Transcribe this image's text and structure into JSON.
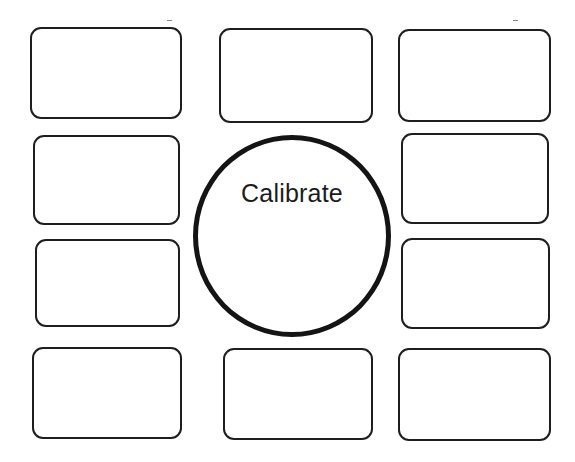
{
  "calibration": {
    "center_button": {
      "label": "Calibrate"
    },
    "targets": [
      {
        "id": 1,
        "position": "top-left"
      },
      {
        "id": 2,
        "position": "top-center"
      },
      {
        "id": 3,
        "position": "top-right"
      },
      {
        "id": 4,
        "position": "upper-left"
      },
      {
        "id": 5,
        "position": "upper-right"
      },
      {
        "id": 6,
        "position": "lower-left"
      },
      {
        "id": 7,
        "position": "lower-right"
      },
      {
        "id": 8,
        "position": "bottom-left"
      },
      {
        "id": 9,
        "position": "bottom-center"
      },
      {
        "id": 10,
        "position": "bottom-right"
      }
    ]
  },
  "colors": {
    "background": "#ffffff",
    "stroke": "#1e1e1e",
    "text": "#1c1c1c"
  }
}
